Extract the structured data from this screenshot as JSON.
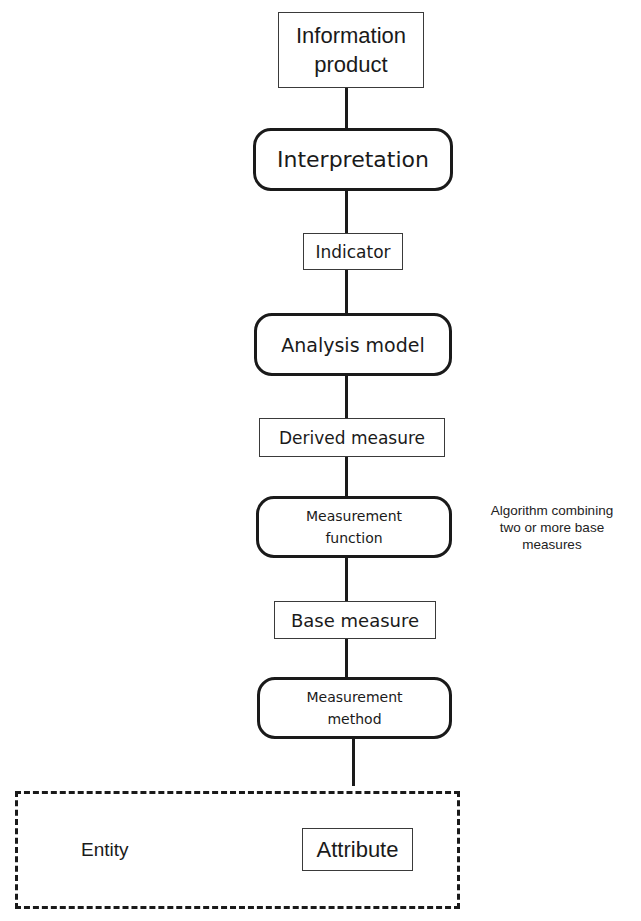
{
  "diagram": {
    "nodes": [
      {
        "id": "information-product",
        "label": "Information product",
        "shape": "rectangle"
      },
      {
        "id": "interpretation",
        "label": "Interpretation",
        "shape": "rounded"
      },
      {
        "id": "indicator",
        "label": "Indicator",
        "shape": "rectangle"
      },
      {
        "id": "analysis-model",
        "label": "Analysis model",
        "shape": "rounded"
      },
      {
        "id": "derived-measure",
        "label": "Derived measure",
        "shape": "rectangle"
      },
      {
        "id": "measurement-function",
        "label": "Measurement function",
        "shape": "rounded"
      },
      {
        "id": "base-measure",
        "label": "Base measure",
        "shape": "rectangle"
      },
      {
        "id": "measurement-method",
        "label": "Measurement method",
        "shape": "rounded"
      },
      {
        "id": "attribute",
        "label": "Attribute",
        "shape": "rectangle"
      }
    ],
    "container": {
      "label": "Entity",
      "style": "dashed"
    },
    "annotation": {
      "target": "measurement-function",
      "text": "Algorithm combining two or more base measures"
    },
    "labels": {
      "info_line1": "Information",
      "info_line2": "product",
      "interpretation": "Interpretation",
      "indicator": "Indicator",
      "analysis_model": "Analysis model",
      "derived_measure": "Derived measure",
      "mf_line1": "Measurement",
      "mf_line2": "function",
      "base_measure": "Base measure",
      "mm_line1": "Measurement",
      "mm_line2": "method",
      "entity": "Entity",
      "attribute": "Attribute",
      "note_line1": "Algorithm combining",
      "note_line2": "two or more base",
      "note_line3": "measures"
    }
  }
}
